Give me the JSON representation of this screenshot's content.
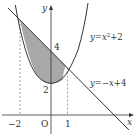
{
  "diagram": {
    "type": "function-graph",
    "curves": [
      {
        "name": "parabola",
        "equation": "y=x²+2",
        "label_y": "y",
        "label_eq": "=x",
        "label_exp": "2",
        "label_tail": "+2"
      },
      {
        "name": "line",
        "equation": "y=−x+4",
        "label_y": "y",
        "label_eq": "=−",
        "label_x": "x",
        "label_tail": "+4"
      }
    ],
    "axes": {
      "x_label": "x",
      "y_label": "y",
      "origin_label": "O"
    },
    "ticks": {
      "x": [
        "−2",
        "1"
      ],
      "y": [
        "2",
        "4"
      ]
    },
    "shaded_region": "between y=−x+4 and y=x²+2 for −2 ≤ x ≤ 1",
    "colors": {
      "shade": "#a8a8a8",
      "line": "#333333",
      "dash": "#888888"
    }
  }
}
